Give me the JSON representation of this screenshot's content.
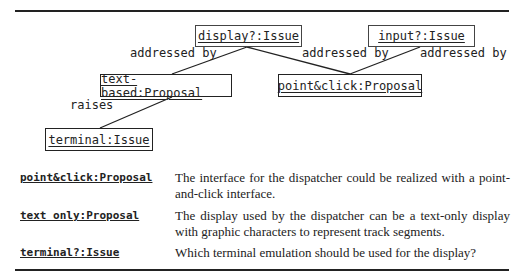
{
  "diagram": {
    "nodes": [
      {
        "id": "display",
        "label": "display?:Issue"
      },
      {
        "id": "input",
        "label": "input?:Issue"
      },
      {
        "id": "text_based",
        "label": "text-based:Proposal"
      },
      {
        "id": "point_click",
        "label": "point&click:Proposal"
      },
      {
        "id": "terminal",
        "label": "terminal:Issue"
      }
    ],
    "edge_labels": {
      "display_textbased": "addressed by",
      "display_pointclick": "addressed by",
      "input_pointclick": "addressed by",
      "textbased_terminal": "raises"
    }
  },
  "glossary": [
    {
      "term": "point&click:Proposal",
      "description": "The interface for the dispatcher could be realized with a point-and-click interface."
    },
    {
      "term": "text only:Proposal",
      "description": "The display used by the dispatcher can be a text-only display with graphic characters to represent track segments."
    },
    {
      "term": "terminal?:Issue",
      "description": "Which terminal emulation should be used for the display?"
    }
  ]
}
